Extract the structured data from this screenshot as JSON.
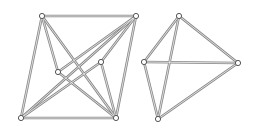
{
  "diagram": {
    "type": "graph",
    "graphs": [
      {
        "name": "left-graph",
        "nodes": [
          {
            "id": "A",
            "x": 42,
            "y": 16
          },
          {
            "id": "B",
            "x": 136,
            "y": 16
          },
          {
            "id": "C",
            "x": 58,
            "y": 72
          },
          {
            "id": "D",
            "x": 101,
            "y": 62
          },
          {
            "id": "E",
            "x": 21,
            "y": 118
          },
          {
            "id": "F",
            "x": 116,
            "y": 118
          }
        ],
        "edges": [
          [
            "A",
            "B"
          ],
          [
            "A",
            "E"
          ],
          [
            "A",
            "C"
          ],
          [
            "A",
            "F"
          ],
          [
            "B",
            "C"
          ],
          [
            "B",
            "D"
          ],
          [
            "B",
            "F"
          ],
          [
            "B",
            "E"
          ],
          [
            "C",
            "F"
          ],
          [
            "D",
            "E"
          ],
          [
            "D",
            "F"
          ],
          [
            "E",
            "F"
          ]
        ]
      },
      {
        "name": "right-graph",
        "nodes": [
          {
            "id": "P",
            "x": 179,
            "y": 16
          },
          {
            "id": "Q",
            "x": 144,
            "y": 62
          },
          {
            "id": "R",
            "x": 238,
            "y": 63
          },
          {
            "id": "S",
            "x": 158,
            "y": 119
          }
        ],
        "edges": [
          [
            "P",
            "Q"
          ],
          [
            "P",
            "R"
          ],
          [
            "P",
            "S"
          ],
          [
            "Q",
            "R"
          ],
          [
            "Q",
            "S"
          ],
          [
            "R",
            "S"
          ]
        ]
      }
    ]
  }
}
